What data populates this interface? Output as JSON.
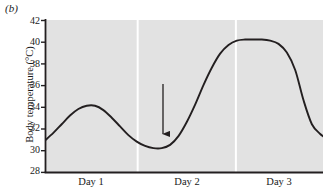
{
  "figure": {
    "panel_label": "(b)",
    "background_color": "#ffffff"
  },
  "chart_data": {
    "type": "line",
    "title": "",
    "subtitle": "",
    "xlabel": "",
    "ylabel": "Body temperature (°C)",
    "ylim": [
      28,
      42
    ],
    "yticks": [
      42,
      40,
      38,
      36,
      34,
      32,
      30,
      28
    ],
    "ytick_labels": [
      "42",
      "40",
      "38",
      "36",
      "34",
      "32",
      "30",
      "28"
    ],
    "xlim": [
      0,
      3
    ],
    "xtick_labels": [
      "Day 1",
      "Day 2",
      "Day 3"
    ],
    "grid": false,
    "legend": "none",
    "plot_background_color": "#e2e2e2",
    "line_color": "#231f20",
    "day_separator_color": "#ffffff",
    "day_separators_x": [
      1.0,
      2.06
    ],
    "series": [
      {
        "name": "Body temperature",
        "x": [
          0.0,
          0.09,
          0.18,
          0.27,
          0.36,
          0.45,
          0.54,
          0.63,
          0.72,
          0.81,
          0.9,
          0.99,
          1.08,
          1.17,
          1.26,
          1.35,
          1.44,
          1.53,
          1.62,
          1.71,
          1.8,
          1.89,
          1.98,
          2.07,
          2.16,
          2.25,
          2.34,
          2.43,
          2.52,
          2.61,
          2.7,
          2.79,
          2.88,
          2.97,
          3.0
        ],
        "values": [
          30.9,
          31.6,
          32.4,
          33.2,
          33.8,
          34.1,
          34.1,
          33.7,
          33.0,
          32.2,
          31.4,
          30.8,
          30.4,
          30.2,
          30.2,
          30.5,
          31.3,
          32.6,
          34.2,
          36.0,
          37.6,
          38.9,
          39.7,
          40.1,
          40.2,
          40.2,
          40.2,
          40.1,
          39.8,
          39.0,
          37.4,
          34.6,
          32.4,
          31.5,
          31.3
        ]
      }
    ],
    "annotations": [
      {
        "text": "Injection of bacteria",
        "text_line1": "Injection",
        "text_line2": "of bacteria",
        "arrow": "down",
        "target_x": 1.37,
        "target_y": 30.6
      }
    ]
  }
}
